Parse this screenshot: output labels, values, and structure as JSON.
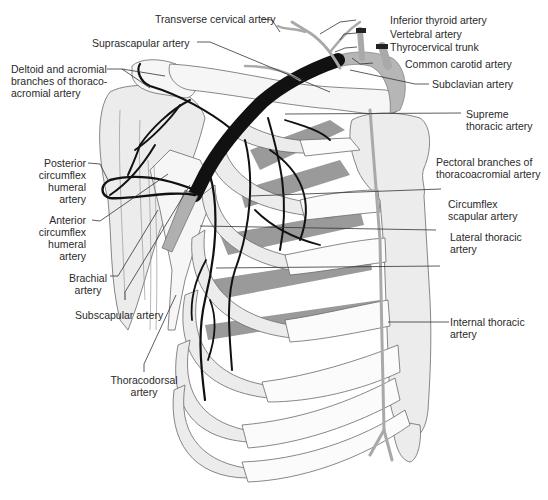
{
  "figure": {
    "colors": {
      "artery": "#111111",
      "bone": "#ececec",
      "muscle": "#9a9a9a",
      "vein_gray": "#a9a9a9",
      "text": "#2a2a2a"
    }
  },
  "labels": {
    "transverse_cervical": "Transverse cervical artery",
    "inferior_thyroid": "Inferior thyroid artery",
    "vertebral": "Vertebral artery",
    "suprascapular": "Suprascapular artery",
    "thyrocervical": "Thyrocervical trunk",
    "common_carotid": "Common carotid artery",
    "deltoid_acromial_1": "Deltoid and acromial",
    "deltoid_acromial_2": "branches of thoraco-",
    "deltoid_acromial_3": "acromial artery",
    "subclavian": "Subclavian artery",
    "supreme_thoracic_1": "Supreme",
    "supreme_thoracic_2": "thoracic artery",
    "posterior_circumflex_1": "Posterior",
    "posterior_circumflex_2": "circumflex",
    "posterior_circumflex_3": "humeral",
    "posterior_circumflex_4": "artery",
    "pectoral_branches_1": "Pectoral branches of",
    "pectoral_branches_2": "thoracoacromial artery",
    "anterior_circumflex_1": "Anterior",
    "anterior_circumflex_2": "circumflex",
    "anterior_circumflex_3": "humeral",
    "anterior_circumflex_4": "artery",
    "circumflex_scapular_1": "Circumflex",
    "circumflex_scapular_2": "scapular artery",
    "lateral_thoracic_1": "Lateral thoracic",
    "lateral_thoracic_2": "artery",
    "brachial_1": "Brachial",
    "brachial_2": "artery",
    "subscapular": "Subscapular artery",
    "internal_thoracic_1": "Internal thoracic",
    "internal_thoracic_2": "artery",
    "thoracodorsal_1": "Thoracodorsal",
    "thoracodorsal_2": "artery"
  }
}
